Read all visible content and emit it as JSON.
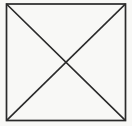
{
  "figure": {
    "canvas": {
      "width": 132,
      "height": 126,
      "background_color": "#f8f8f6"
    },
    "style": {
      "stroke_color": "#2a2a2a",
      "stroke_width": 1.6,
      "fill_color": "#fdfdfc"
    },
    "shapes": [
      {
        "name": "square-outline",
        "type": "rect",
        "x": 6.5,
        "y": 4.0,
        "width": 119.0,
        "height": 116.5,
        "stroke_color": "#2a2a2a",
        "stroke_width": 1.7,
        "fill_color": "#fdfdfc"
      },
      {
        "name": "diagonal-top-left-to-bottom-right",
        "type": "line",
        "x1": 7.0,
        "y1": 4.5,
        "x2": 125.0,
        "y2": 120.0,
        "stroke_color": "#2a2a2a",
        "stroke_width": 1.6
      },
      {
        "name": "diagonal-top-right-to-bottom-left",
        "type": "line",
        "x1": 125.0,
        "y1": 4.5,
        "x2": 7.0,
        "y2": 120.0,
        "stroke_color": "#2a2a2a",
        "stroke_width": 1.6
      }
    ],
    "center_point": {
      "name": "diagonal-intersection",
      "x": 66.0,
      "y": 62.2
    },
    "corners": {
      "top_left": {
        "x": 6.5,
        "y": 4.0
      },
      "top_right": {
        "x": 125.5,
        "y": 4.0
      },
      "bottom_left": {
        "x": 6.5,
        "y": 120.5
      },
      "bottom_right": {
        "x": 125.5,
        "y": 120.5
      }
    }
  }
}
